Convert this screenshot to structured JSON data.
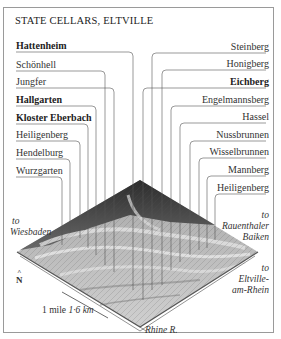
{
  "title": "STATE CELLARS, ELTVILLE",
  "left_labels": [
    {
      "label": "Hattenheim",
      "bold": true
    },
    {
      "label": "Schönhell",
      "bold": false
    },
    {
      "label": "Jungfer",
      "bold": false
    },
    {
      "label": "Hallgarten",
      "bold": true
    },
    {
      "label": "Kloster Eberbach",
      "bold": true
    },
    {
      "label": "Heiligenberg",
      "bold": false
    },
    {
      "label": "Hendelburg",
      "bold": false
    },
    {
      "label": "Wurzgarten",
      "bold": false
    }
  ],
  "right_labels": [
    {
      "label": "Steinberg",
      "bold": false
    },
    {
      "label": "Honigberg",
      "bold": false
    },
    {
      "label": "Eichberg",
      "bold": true
    },
    {
      "label": "Engelmannsberg",
      "bold": false
    },
    {
      "label": "Hassel",
      "bold": false
    },
    {
      "label": "Nussbrunnen",
      "bold": false
    },
    {
      "label": "Wisselbrunnen",
      "bold": false
    },
    {
      "label": "Mannberg",
      "bold": false
    },
    {
      "label": "Heiligenberg",
      "bold": false
    }
  ],
  "directions": {
    "wiesbaden": {
      "to": "to",
      "place": "Wiesbaden"
    },
    "rauenthal": {
      "to": "to",
      "place1": "Rauenthaler",
      "place2": "Baiken"
    },
    "eltville": {
      "to": "to",
      "place1": "Eltville-",
      "place2": "am-Rhein"
    }
  },
  "river": "Rhine R.",
  "north": {
    "arrow": "^",
    "letter": "N"
  },
  "scale": {
    "mile": "1 mile",
    "km": "1·6 km"
  }
}
